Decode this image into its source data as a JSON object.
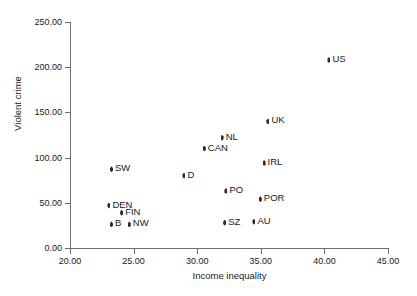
{
  "chart_data": {
    "type": "scatter",
    "title": "",
    "xlabel": "Income inequality",
    "ylabel": "Violent crime",
    "xlim": [
      20.0,
      45.0
    ],
    "ylim": [
      0.0,
      250.0
    ],
    "grid": false,
    "legend": "none",
    "x_ticks": [
      "20.00",
      "25.00",
      "30.00",
      "35.00",
      "40.00",
      "45.00"
    ],
    "x_tick_values": [
      20.0,
      25.0,
      30.0,
      35.0,
      40.0,
      45.0
    ],
    "y_ticks": [
      "0.00",
      "50.00",
      "100.00",
      "150.00",
      "200.00",
      "250.00"
    ],
    "y_tick_values": [
      0.0,
      50.0,
      100.0,
      150.0,
      200.0,
      250.0
    ],
    "points": [
      {
        "label": "US",
        "x": 40.4,
        "y": 208.0,
        "label_side": "right"
      },
      {
        "label": "UK",
        "x": 35.6,
        "y": 140.0,
        "label_side": "right"
      },
      {
        "label": "NL",
        "x": 32.0,
        "y": 122.0,
        "label_side": "right"
      },
      {
        "label": "CAN",
        "x": 30.6,
        "y": 110.0,
        "label_side": "right"
      },
      {
        "label": "IRL",
        "x": 35.3,
        "y": 94.0,
        "label_side": "right"
      },
      {
        "label": "SW",
        "x": 23.3,
        "y": 87.0,
        "label_side": "right"
      },
      {
        "label": "D",
        "x": 29.0,
        "y": 80.0,
        "label_side": "right"
      },
      {
        "label": "PO",
        "x": 32.3,
        "y": 63.0,
        "label_side": "right"
      },
      {
        "label": "POR",
        "x": 35.0,
        "y": 54.0,
        "label_side": "right"
      },
      {
        "label": "DEN",
        "x": 23.1,
        "y": 47.0,
        "label_side": "right"
      },
      {
        "label": "FIN",
        "x": 24.1,
        "y": 39.0,
        "label_side": "right"
      },
      {
        "label": "SZ",
        "x": 32.2,
        "y": 28.0,
        "label_side": "right"
      },
      {
        "label": "AU",
        "x": 34.5,
        "y": 29.0,
        "label_side": "right"
      },
      {
        "label": "B",
        "x": 23.3,
        "y": 26.0,
        "label_side": "right"
      },
      {
        "label": "NW",
        "x": 24.7,
        "y": 26.0,
        "label_side": "right"
      }
    ],
    "colors": {
      "marker": "#2b2b2b",
      "axis": "#6e6e6e",
      "text": "#1a1a1a",
      "background": "#ffffff"
    }
  }
}
